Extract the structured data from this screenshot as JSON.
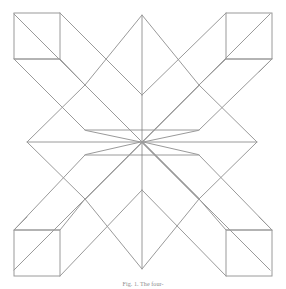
{
  "figure": {
    "caption": "Fig. 1. The four-pointed radiating pattern with eight-fold symmetry",
    "caption_visible_fragment": "Fig. 1. The four-",
    "background_color": "#ffffff",
    "stroke_color": "#9a9a9a",
    "stroke_width": 1,
    "width": 286,
    "height": 289
  },
  "geometry": {
    "center": {
      "x": 142,
      "y": 142
    },
    "half_diagonal": 115,
    "square_side": 46,
    "diamond_half_width": 57,
    "description": "Eight-pointed star rosette: four axis-aligned rhombi meeting at center, four diagonal parallelogram arms each ending in an axis-aligned square at the corners."
  },
  "shapes": {
    "center_star_points": 8,
    "corner_squares": [
      {
        "name": "top-left-square",
        "x": 14,
        "y": 13,
        "size": 46
      },
      {
        "name": "top-right-square",
        "x": 226,
        "y": 13,
        "size": 46
      },
      {
        "name": "bottom-left-square",
        "x": 14,
        "y": 230,
        "size": 46
      },
      {
        "name": "bottom-right-square",
        "x": 226,
        "y": 230,
        "size": 46
      }
    ],
    "axis_diamonds": [
      {
        "name": "top-diamond",
        "cx": 142,
        "cy": 72,
        "rx": 57,
        "ry": 57
      },
      {
        "name": "bottom-diamond",
        "cx": 142,
        "cy": 212,
        "rx": 57,
        "ry": 57
      },
      {
        "name": "left-diamond",
        "cx": 84,
        "cy": 142,
        "rx": 57,
        "ry": 57
      },
      {
        "name": "right-diamond",
        "cx": 200,
        "cy": 142,
        "rx": 57,
        "ry": 57
      }
    ],
    "diagonal_arms": [
      {
        "name": "arm-top-left"
      },
      {
        "name": "arm-top-right"
      },
      {
        "name": "arm-bottom-left"
      },
      {
        "name": "arm-bottom-right"
      }
    ]
  }
}
